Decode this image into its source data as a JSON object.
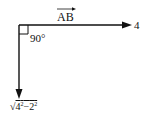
{
  "diagram": {
    "vector_label": "AB",
    "horizontal_magnitude": "4",
    "angle_label": "90°",
    "vertical_magnitude": {
      "radical": "√",
      "base1": "4",
      "exp1": "2",
      "op": "−",
      "base2": "2",
      "exp2": "2"
    },
    "colors": {
      "line": "#111111",
      "background": "#ffffff"
    }
  }
}
